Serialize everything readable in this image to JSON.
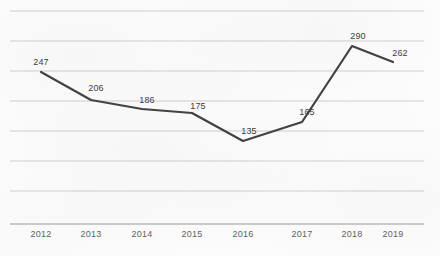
{
  "chart_data": {
    "type": "line",
    "title": "",
    "subtitle": "",
    "xlabel": "",
    "ylabel": "",
    "categories": [
      "2012",
      "2013",
      "2014",
      "2015",
      "2016",
      "2017",
      "2018",
      "2019"
    ],
    "values": [
      247,
      206,
      186,
      175,
      135,
      165,
      290,
      262
    ],
    "series": [
      {
        "name": "",
        "values": [
          247,
          206,
          186,
          175,
          135,
          165,
          290,
          262
        ]
      }
    ],
    "data_labels": [
      "247",
      "206",
      "186",
      "175",
      "135",
      "165",
      "290",
      "262"
    ],
    "ylim": [
      0,
      353
    ],
    "xlim": [
      0,
      7
    ],
    "grid": true,
    "gridlines_y": [
      44,
      88,
      132,
      176,
      220,
      265,
      309,
      353
    ],
    "legend": "none",
    "y_axis_visible": false,
    "y_tick_labels": [],
    "x_tick_labels": [
      "2012",
      "2013",
      "2014",
      "2015",
      "2016",
      "2017",
      "2018",
      "2019"
    ],
    "marker": "none",
    "colors": {
      "line": "#3f3f3f",
      "gridline": "#cfcfcf",
      "axis": "#9a9a9a",
      "tick_label": "#5d5d5d",
      "data_label": "#3a3a3a",
      "background": "#fdfdfd"
    },
    "line_width_px": 2.2
  },
  "layout": {
    "plot_left_px": 10,
    "plot_right_px": 424,
    "plot_top_px": 11,
    "axis_y_px": 224,
    "gridline_y_px": [
      11,
      41,
      71,
      101,
      131,
      161,
      191
    ],
    "point_x_px": [
      41,
      91,
      142,
      192,
      243,
      302,
      352,
      393
    ],
    "point_y_px": [
      72,
      100,
      109,
      113,
      141,
      122,
      46,
      62
    ],
    "data_label_x_px": [
      41,
      96,
      147,
      198,
      249,
      307,
      358,
      400
    ],
    "data_label_y_px": [
      57,
      83,
      95,
      101,
      126,
      107,
      31,
      48
    ],
    "tick_label_y_px": 229
  }
}
